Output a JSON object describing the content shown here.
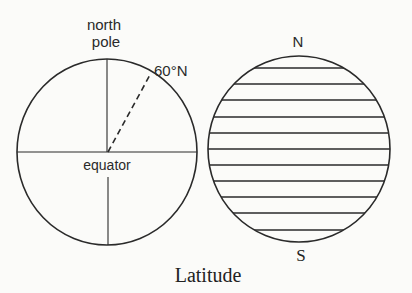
{
  "figure": {
    "caption": "Latitude",
    "left_globe": {
      "labels": {
        "north_pole_line1": "north",
        "north_pole_line2": "pole",
        "latitude_marker": "60°N",
        "equator": "equator"
      }
    },
    "right_globe": {
      "labels": {
        "north": "N",
        "south": "S"
      },
      "parallel_count": 11
    }
  },
  "colors": {
    "line": "#2a2a2a",
    "background": "#fbfbf9"
  }
}
